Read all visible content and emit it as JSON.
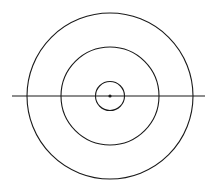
{
  "diagram": {
    "background": "#ffffff",
    "stroke_color": "#1a1a1a",
    "center": {
      "x": 110,
      "y": 96
    },
    "circles": [
      {
        "name": "outer-circle",
        "r": 83
      },
      {
        "name": "middle-circle",
        "r": 49
      },
      {
        "name": "inner-circle",
        "r": 14.5
      }
    ],
    "center_dot": {
      "r": 1.6
    },
    "horizontal_line": {
      "x1": 12,
      "x2": 205,
      "y": 96
    }
  }
}
